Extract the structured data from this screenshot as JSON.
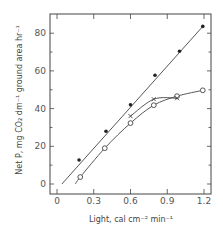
{
  "chart_data": {
    "type": "line",
    "title": "",
    "xlabel": "Light, cal cm⁻² min⁻¹",
    "ylabel": "Net P, mg CO₂ dm⁻¹ ground area hr⁻¹",
    "xlim": [
      -0.05,
      1.25
    ],
    "ylim": [
      -5,
      90
    ],
    "xticks": [
      0,
      0.3,
      0.6,
      0.9,
      1.2
    ],
    "xtick_labels": [
      "0",
      "0.3",
      "0.6",
      "0.9",
      "1.2"
    ],
    "yticks": [
      0,
      20,
      40,
      60,
      80
    ],
    "ytick_labels": [
      "0",
      "20",
      "40",
      "60",
      "80"
    ],
    "grid": false,
    "legend": null,
    "series": [
      {
        "name": "filled circles",
        "marker": "filled-circle",
        "line": "straight",
        "x": [
          0.18,
          0.4,
          0.6,
          0.8,
          1.0,
          1.19
        ],
        "y": [
          12.7,
          28,
          42,
          57.7,
          70.4,
          83.6
        ],
        "line_start": [
          0.04,
          0
        ]
      },
      {
        "name": "open circles",
        "marker": "open-circle",
        "line": "curve",
        "x": [
          0.19,
          0.39,
          0.6,
          0.79,
          0.98,
          1.19
        ],
        "y": [
          3.7,
          19,
          32.3,
          41.8,
          46.6,
          49.7
        ],
        "line_start": [
          0.15,
          0
        ]
      },
      {
        "name": "crosses",
        "marker": "x",
        "line": "curve",
        "x": [
          0.6,
          0.79,
          0.98
        ],
        "y": [
          36,
          45,
          45.5
        ]
      }
    ]
  }
}
